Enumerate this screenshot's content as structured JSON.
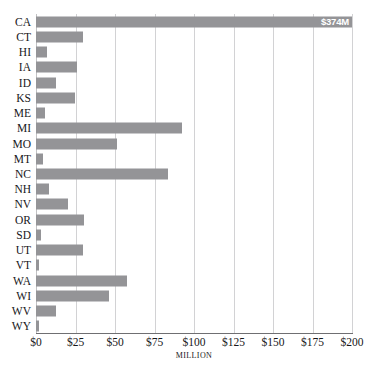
{
  "top_clip_text": "                                                                                                                    ",
  "chart_data": {
    "type": "bar",
    "orientation": "horizontal",
    "title": "",
    "xlabel": "MILLION",
    "ylabel": "",
    "xlim": [
      0,
      200
    ],
    "grid": true,
    "legend": null,
    "bar_color": "#949497",
    "gridline_color": "#d2d2d4",
    "axis_color": "#6f6f72",
    "xticks": [
      {
        "value": 0,
        "label": "$0"
      },
      {
        "value": 25,
        "label": "$25"
      },
      {
        "value": 50,
        "label": "$50"
      },
      {
        "value": 75,
        "label": "$75"
      },
      {
        "value": 100,
        "label": "$100"
      },
      {
        "value": 125,
        "label": "$125"
      },
      {
        "value": 150,
        "label": "$150"
      },
      {
        "value": 175,
        "label": "$175"
      },
      {
        "value": 200,
        "label": "$200"
      }
    ],
    "categories": [
      "CA",
      "CT",
      "HI",
      "IA",
      "ID",
      "KS",
      "ME",
      "MI",
      "MO",
      "MT",
      "NC",
      "NH",
      "NV",
      "OR",
      "SD",
      "UT",
      "VT",
      "WA",
      "WI",
      "WV",
      "WY"
    ],
    "values": [
      374,
      29.6,
      6.8,
      25.8,
      12.7,
      24.9,
      5.7,
      92.2,
      51.5,
      4.2,
      83.4,
      8.2,
      20.3,
      30.4,
      3.4,
      30.0,
      2.0,
      57.4,
      46.4,
      12.7,
      2.1
    ],
    "data_labels": [
      "$374M",
      "",
      "",
      "",
      "",
      "",
      "",
      "",
      "",
      "",
      "",
      "",
      "",
      "",
      "",
      "",
      "",
      "",
      "",
      "",
      ""
    ]
  }
}
